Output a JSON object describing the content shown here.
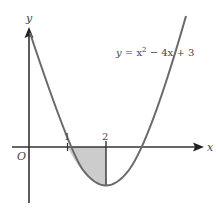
{
  "figure": {
    "type": "function-graph",
    "equation_label": {
      "y": "y",
      "eq": " = x",
      "exp": "2",
      "rest": " − 4x + 3"
    },
    "axes": {
      "x_label": "x",
      "y_label": "y",
      "origin_label": "O"
    },
    "ticks": [
      {
        "value": 1,
        "label": "1"
      },
      {
        "value": 2,
        "label": "2"
      }
    ],
    "shaded_region": {
      "from": 1,
      "to": 2,
      "description": "area between curve and x-axis from x=1 to x=2",
      "fill": "#cccccc"
    },
    "colors": {
      "axis": "#333333",
      "curve": "#666666",
      "shade": "#cccccc"
    }
  }
}
